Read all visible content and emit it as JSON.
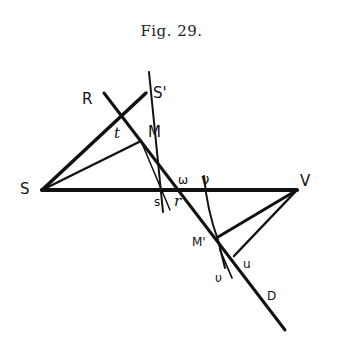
{
  "figure": {
    "caption": "Fig. 29.",
    "labels": {
      "R": "R",
      "S_prime": "S'",
      "t": "t",
      "M": "M",
      "S": "S",
      "omega": "ω",
      "s": "s",
      "r": "r",
      "nu": "ν",
      "V": "V",
      "M_prime": "M'",
      "upsilon": "υ",
      "u": "u",
      "D": "D"
    },
    "points": {
      "S": [
        42,
        190
      ],
      "V": [
        297,
        190
      ],
      "R_end": [
        104,
        93
      ],
      "S_prime": [
        146,
        90
      ],
      "M": [
        141,
        142
      ],
      "t": [
        122,
        123
      ],
      "M_prime": [
        218,
        237
      ],
      "u_foot": [
        235,
        255
      ],
      "D_end": [
        285,
        330
      ],
      "S_prime_top": [
        149,
        72
      ]
    },
    "colors": {
      "ink": "#111111",
      "background": "#ffffff"
    }
  }
}
